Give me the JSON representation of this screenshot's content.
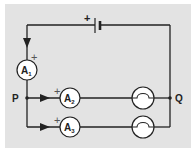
{
  "diagram": {
    "type": "circuit",
    "colors": {
      "background": "#e3e3e3",
      "wire": "#222222",
      "component_fill": "#ffffff"
    },
    "battery": {
      "polarity_label": "+"
    },
    "ammeters": [
      {
        "id": "A1",
        "letter": "A",
        "subscript": "1",
        "polarity_label": "+"
      },
      {
        "id": "A2",
        "letter": "A",
        "subscript": "2",
        "polarity_label": "+"
      },
      {
        "id": "A3",
        "letter": "A",
        "subscript": "3",
        "polarity_label": "+"
      }
    ],
    "lamps": [
      {
        "id": "lamp-1"
      },
      {
        "id": "lamp-2"
      }
    ],
    "junctions": [
      {
        "label": "P"
      },
      {
        "label": "Q"
      }
    ]
  }
}
